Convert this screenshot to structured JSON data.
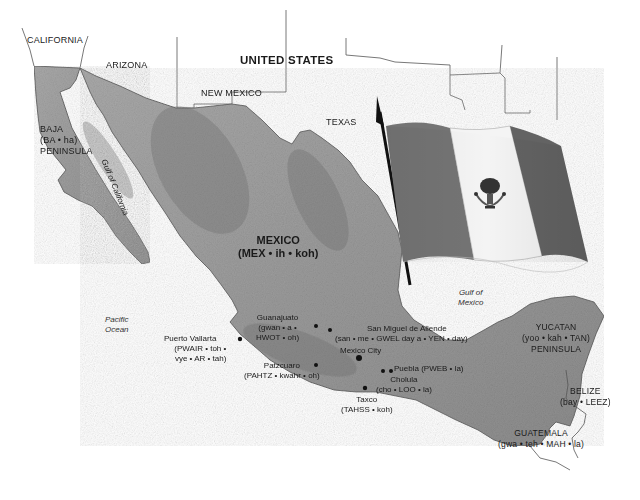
{
  "map": {
    "title": "Map of Mexico with national flag",
    "colors": {
      "land_mexico": "#9a9a9a",
      "land_mexico_dark": "#7c7c7c",
      "land_us": "#ffffff",
      "water": "#ffffff",
      "border_line": "#555555",
      "flag_left": "#6e6e6e",
      "flag_center": "#f5f5f5",
      "flag_right": "#5e5e5e",
      "text": "#1a1a1a"
    },
    "us_states": {
      "california": "CALIFORNIA",
      "arizona": "ARIZONA",
      "new_mexico": "NEW MEXICO",
      "texas": "TEXAS"
    },
    "countries": {
      "united_states": "UNITED STATES",
      "mexico": {
        "name": "MEXICO",
        "pronunciation": "(MEX • ih • koh)"
      },
      "belize": {
        "name": "BELIZE",
        "pronunciation": "(bay • LEEZ)"
      },
      "guatemala": {
        "name": "GUATEMALA",
        "pronunciation": "(gwa • teh • MAH • la)"
      }
    },
    "regions": {
      "baja": {
        "line1": "BAJA",
        "line2": "(BA • ha)",
        "line3": "PENINSULA"
      },
      "yucatan": {
        "line1": "YUCATAN",
        "line2": "(yoo • kah • TAN)",
        "line3": "PENINSULA"
      }
    },
    "water_bodies": {
      "gulf_of_california": "Gulf of California",
      "pacific_line1": "Pacific",
      "pacific_line2": "Ocean",
      "gulf_of_mexico_line1": "Gulf of",
      "gulf_of_mexico_line2": "Mexico"
    },
    "cities": [
      {
        "name": "Guanajuato",
        "pron1": "(gwan • a •",
        "pron2": "HWOT • oh)"
      },
      {
        "name": "San Miguel de Allende",
        "pron1": "(san • me • GWEL day a • YEN • day)"
      },
      {
        "name": "Puerto Vallarta",
        "pron1": "(PWAIR • toh •",
        "pron2": "vye • AR • tah)"
      },
      {
        "name": "Mexico City"
      },
      {
        "name": "Patzcuaro",
        "pron1": "(PAHTZ • kwahr • oh)"
      },
      {
        "name": "Puebla",
        "pron1": "(PWEB • la)"
      },
      {
        "name": "Cholula",
        "pron1": "(cho • LOO • la)"
      },
      {
        "name": "Taxco",
        "pron1": "(TAHSS • koh)"
      }
    ],
    "flag": {
      "country": "Mexico",
      "stripes": [
        "green",
        "white",
        "red"
      ],
      "emblem": "eagle-on-cactus"
    }
  }
}
